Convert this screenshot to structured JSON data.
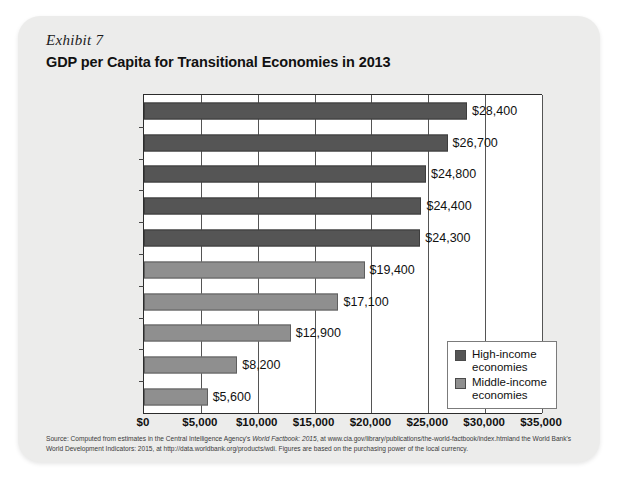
{
  "exhibit": {
    "label": "Exhibit 7"
  },
  "chart_data": {
    "type": "bar",
    "orientation": "horizontal",
    "title": "GDP per Capita for Transitional Economies in 2013",
    "xlabel": "",
    "ylabel": "",
    "xlim": [
      0,
      35000
    ],
    "grid": true,
    "categories": [
      "Czech Republic",
      "Lithuania",
      "Russia",
      "Poland",
      "Hungary",
      "Romania",
      "Bulgaria",
      "China",
      "Ukraine",
      "Vietnam"
    ],
    "values": [
      28400,
      26700,
      24800,
      24400,
      24300,
      19400,
      17100,
      12900,
      8200,
      5600
    ],
    "value_labels": [
      "$28,400",
      "$26,700",
      "$24,800",
      "$24,400",
      "$24,300",
      "$19,400",
      "$17,100",
      "$12,900",
      "$8,200",
      "$5,600"
    ],
    "groups": [
      "high",
      "high",
      "high",
      "high",
      "high",
      "middle",
      "middle",
      "middle",
      "middle",
      "middle"
    ],
    "tick_labels": [
      "$0",
      "$5,000",
      "$10,000",
      "$15,000",
      "$20,000",
      "$25,000",
      "$30,000",
      "$35,000"
    ],
    "tick_values": [
      0,
      5000,
      10000,
      15000,
      20000,
      25000,
      30000,
      35000
    ],
    "colors": {
      "high": "#555555",
      "middle": "#8f8f8f"
    },
    "legend": {
      "position": "inside-right",
      "entries": [
        {
          "key": "high",
          "line1": "High-income",
          "line2": "economies"
        },
        {
          "key": "middle",
          "line1": "Middle-income",
          "line2": "economies"
        }
      ]
    }
  },
  "source": {
    "line1_pre": "Source: Computed from estimates in the Central Intelligence Agency's ",
    "line1_italic": "World Factbook: 2015",
    "line1_post": ", at www.cia.gov/library/publications/the-world-factbook/index.htmland the",
    "line2": "World Bank's World Development Indicators: 2015, at http://data.worldbank.org/products/wdi. Figures are based on the purchasing power of the local currency."
  }
}
